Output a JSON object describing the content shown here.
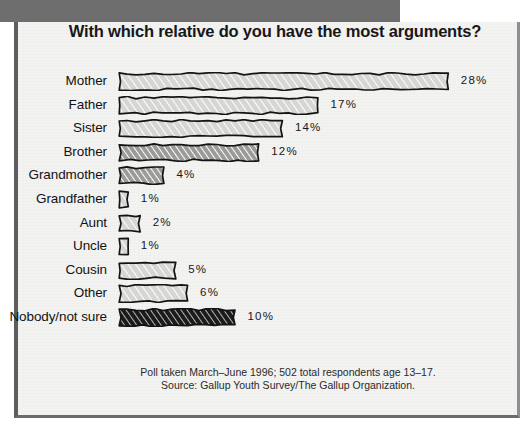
{
  "chart_data": {
    "type": "bar",
    "orientation": "horizontal",
    "title": "With which relative do you have the most arguments?",
    "xlabel": "",
    "ylabel": "",
    "xlim": [
      0,
      28
    ],
    "grid": false,
    "legend": "none",
    "value_suffix": "%",
    "categories": [
      "Mother",
      "Father",
      "Sister",
      "Brother",
      "Grandmother",
      "Grandfather",
      "Aunt",
      "Uncle",
      "Cousin",
      "Other",
      "Nobody/not sure"
    ],
    "values": [
      28,
      17,
      14,
      12,
      4,
      1,
      2,
      1,
      5,
      6,
      10
    ],
    "value_labels": [
      "28%",
      "17%",
      "14%",
      "12%",
      "4%",
      "1%",
      "2%",
      "1%",
      "5%",
      "6%",
      "10%"
    ],
    "fills": [
      "light-hatch",
      "light-hatch",
      "light-hatch",
      "dark-hatch",
      "dark-hatch",
      "light-hatch",
      "light-hatch",
      "light-hatch",
      "light-hatch",
      "light-hatch",
      "black-hatch"
    ],
    "annotations": [
      "Poll taken March–June 1996; 502 total respondents age 13–17.",
      "Source: Gallup Youth Survey/The Gallup Organization."
    ]
  },
  "footnote": {
    "line1": "Poll taken March–June 1996; 502 total respondents age 13–17.",
    "line2": "Source: Gallup Youth Survey/The Gallup Organization."
  },
  "colors": {
    "header_band": "#6e6e6e",
    "panel_background": "#f3f3f1",
    "bar_light": "#d6d6d4",
    "bar_dark": "#9b9b99",
    "bar_black": "#1b1b1b",
    "outline": "#141414",
    "text": "#17171a"
  }
}
